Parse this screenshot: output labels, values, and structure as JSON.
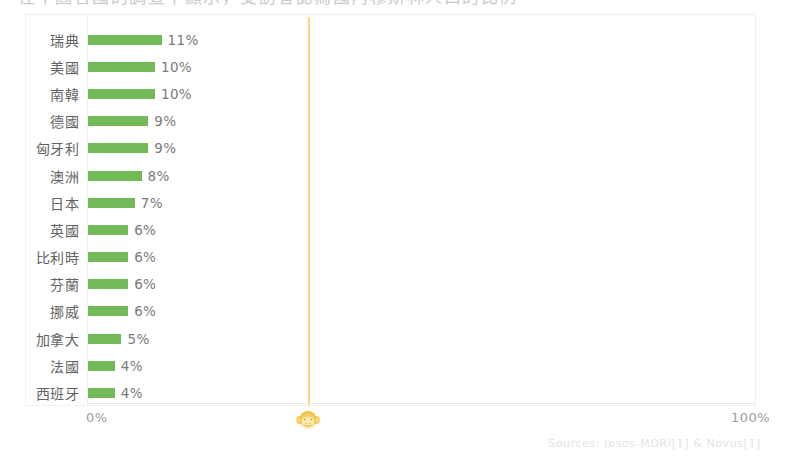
{
  "clipped_header": {
    "text": "在下圖各國的調查中顯示，受訪者認為國內穆斯林人口的比例"
  },
  "chart_data": {
    "type": "bar",
    "orientation": "horizontal",
    "title": "",
    "subtitle": "",
    "xlabel": "",
    "ylabel": "",
    "categories": [
      "瑞典",
      "美國",
      "南韓",
      "德國",
      "匈牙利",
      "澳洲",
      "日本",
      "英國",
      "比利時",
      "芬蘭",
      "挪威",
      "加拿大",
      "法國",
      "西班牙"
    ],
    "values": [
      11,
      10,
      10,
      9,
      9,
      8,
      7,
      6,
      6,
      6,
      6,
      5,
      4,
      4
    ],
    "value_labels": [
      "11%",
      "10%",
      "10%",
      "9%",
      "9%",
      "8%",
      "7%",
      "6%",
      "6%",
      "6%",
      "6%",
      "5%",
      "4%",
      "4%"
    ],
    "xlim": [
      0,
      100
    ],
    "grid": false,
    "legend": null,
    "bar_color": "#73b958",
    "marker_line": {
      "value": 33,
      "color": "#f5d97a",
      "icon": "monkey-icon"
    },
    "axis_ticks": {
      "min_label": "0%",
      "max_label": "100%"
    },
    "source": "Sources: Ipsos-MORI[1] & Novus[1]"
  },
  "colors": {
    "bar": "#73b958",
    "marker": "#f5d97a",
    "axis": "#ececec",
    "text": "#6d6d6d",
    "tick_text": "#9d9d9d",
    "source_text": "#e3e3e6"
  }
}
